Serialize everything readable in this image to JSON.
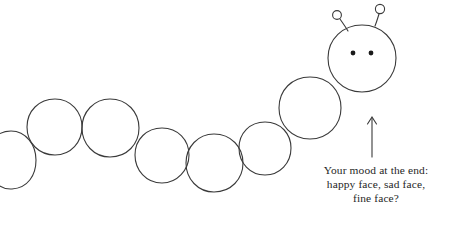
{
  "image": {
    "title": "Caterpillar mood diagram",
    "background_color": "#ffffff",
    "width": 458,
    "height": 226
  },
  "drawing": {
    "style": "hand-drawn line art",
    "stroke_color": "#3a3a3a",
    "stroke_width": 1,
    "fill": "none",
    "eye_color": "#1a1a1a",
    "creature": "caterpillar",
    "body_segment_count": 7,
    "has_head": true,
    "antenna_count": 2,
    "eye_count": 2
  },
  "annotation": {
    "arrow": {
      "name": "up-arrow",
      "direction": "up",
      "color": "#3a3a3a",
      "x": 372,
      "y_top": 117,
      "y_bottom": 157
    },
    "caption_lines": [
      "Your mood at the end:",
      "happy face, sad face,",
      "fine face?"
    ],
    "caption_color": "#262626",
    "caption_align": "center"
  }
}
